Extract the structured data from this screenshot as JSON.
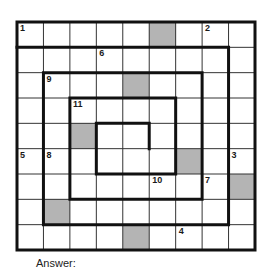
{
  "puzzle": {
    "rows": 9,
    "cols": 9,
    "shade_color": "#b4b4b4",
    "shaded_cells": [
      [
        0,
        5
      ],
      [
        2,
        4
      ],
      [
        4,
        2
      ],
      [
        5,
        6
      ],
      [
        6,
        8
      ],
      [
        7,
        1
      ],
      [
        8,
        4
      ]
    ],
    "clue_numbers": [
      {
        "n": "1",
        "row": 0,
        "col": 0
      },
      {
        "n": "2",
        "row": 0,
        "col": 7
      },
      {
        "n": "3",
        "row": 5,
        "col": 8
      },
      {
        "n": "4",
        "row": 8,
        "col": 6
      },
      {
        "n": "5",
        "row": 5,
        "col": 0
      },
      {
        "n": "6",
        "row": 1,
        "col": 3
      },
      {
        "n": "7",
        "row": 6,
        "col": 7
      },
      {
        "n": "8",
        "row": 5,
        "col": 1
      },
      {
        "n": "9",
        "row": 2,
        "col": 1
      },
      {
        "n": "10",
        "row": 6,
        "col": 5
      },
      {
        "n": "11",
        "row": 3,
        "col": 2
      }
    ],
    "spiral_path": [
      [
        0,
        1
      ],
      [
        8,
        1
      ],
      [
        8,
        8
      ],
      [
        1,
        8
      ],
      [
        1,
        2
      ],
      [
        7,
        2
      ],
      [
        7,
        7
      ],
      [
        2,
        7
      ],
      [
        2,
        3
      ],
      [
        6,
        3
      ],
      [
        6,
        6
      ],
      [
        3,
        6
      ],
      [
        3,
        4
      ],
      [
        5,
        4
      ],
      [
        5,
        5
      ]
    ]
  },
  "answer_label": "Answer:"
}
